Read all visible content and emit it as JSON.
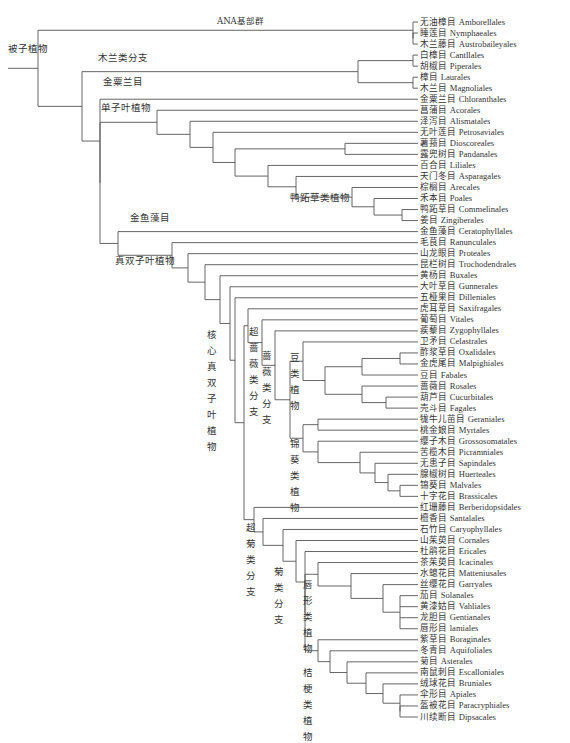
{
  "diagram": {
    "type": "phylogenetic-tree",
    "root_label": "被子植物",
    "leaves": [
      {
        "cn": "无油樟目",
        "en": "Amborellales"
      },
      {
        "cn": "睡莲目",
        "en": "Nymphaeales"
      },
      {
        "cn": "木兰藤目",
        "en": "Austrobaileyales"
      },
      {
        "cn": "白樟目",
        "en": "Cantllales"
      },
      {
        "cn": "胡椒目",
        "en": "Piperales"
      },
      {
        "cn": "樟目",
        "en": "Laurales"
      },
      {
        "cn": "木兰目",
        "en": "Magnoliales"
      },
      {
        "cn": "金粟兰目",
        "en": "Chloranthales"
      },
      {
        "cn": "菖蒲目",
        "en": "Acorales"
      },
      {
        "cn": "泽泻目",
        "en": "Alismatales"
      },
      {
        "cn": "无叶莲目",
        "en": "Petrosaviales"
      },
      {
        "cn": "薯蓣目",
        "en": "Dioscoreales"
      },
      {
        "cn": "露兜树目",
        "en": "Pandanales"
      },
      {
        "cn": "百合目",
        "en": "Liliales"
      },
      {
        "cn": "天门冬目",
        "en": "Asparagales"
      },
      {
        "cn": "棕榈目",
        "en": "Arecales"
      },
      {
        "cn": "禾本目",
        "en": "Poales"
      },
      {
        "cn": "鸭跖草目",
        "en": "Commelinales"
      },
      {
        "cn": "姜目",
        "en": "Zingiberales"
      },
      {
        "cn": "金鱼藻目",
        "en": "Ceratophyllales"
      },
      {
        "cn": "毛茛目",
        "en": "Ranunculales"
      },
      {
        "cn": "山龙眼目",
        "en": "Proteales"
      },
      {
        "cn": "昆栏树目",
        "en": "Trochodendrales"
      },
      {
        "cn": "黄杨目",
        "en": "Buxales"
      },
      {
        "cn": "大叶草目",
        "en": "Gunnerales"
      },
      {
        "cn": "五桠果目",
        "en": "Dilleniales"
      },
      {
        "cn": "虎耳草目",
        "en": "Saxifragales"
      },
      {
        "cn": "葡萄目",
        "en": "Vitales"
      },
      {
        "cn": "蒺藜目",
        "en": "Zygophyllales"
      },
      {
        "cn": "卫矛目",
        "en": "Celastrales"
      },
      {
        "cn": "酢浆草目",
        "en": "Oxalidales"
      },
      {
        "cn": "金虎尾目",
        "en": "Malpighiales"
      },
      {
        "cn": "豆目",
        "en": "Fabales"
      },
      {
        "cn": "蔷薇目",
        "en": "Rosales"
      },
      {
        "cn": "葫芦目",
        "en": "Cucurbitales"
      },
      {
        "cn": "壳斗目",
        "en": "Fagales"
      },
      {
        "cn": "牻牛儿苗目",
        "en": "Geraniales"
      },
      {
        "cn": "桃金娘目",
        "en": "Myrtales"
      },
      {
        "cn": "缨子木目",
        "en": "Grossosomatales"
      },
      {
        "cn": "苦榄木目",
        "en": "Picramniales"
      },
      {
        "cn": "无患子目",
        "en": "Sapindales"
      },
      {
        "cn": "腺椒树目",
        "en": "Huerteales"
      },
      {
        "cn": "锦葵目",
        "en": "Malvales"
      },
      {
        "cn": "十字花目",
        "en": "Brassicales"
      },
      {
        "cn": "红珊藤目",
        "en": "Berberidopsidales"
      },
      {
        "cn": "檀香目",
        "en": "Santalales"
      },
      {
        "cn": "石竹目",
        "en": "Caryophyllales"
      },
      {
        "cn": "山茱萸目",
        "en": "Cornales"
      },
      {
        "cn": "杜鹃花目",
        "en": "Ericales"
      },
      {
        "cn": "茶茱萸目",
        "en": "Icacinales"
      },
      {
        "cn": "水螅花目",
        "en": "Matteniusales"
      },
      {
        "cn": "丝缨花目",
        "en": "Garryales"
      },
      {
        "cn": "茄目",
        "en": "Solanales"
      },
      {
        "cn": "黄漆姑目",
        "en": "Vahliales"
      },
      {
        "cn": "龙胆目",
        "en": "Gentianales"
      },
      {
        "cn": "唇形目",
        "en": "lamiales"
      },
      {
        "cn": "紫草目",
        "en": "Boraginales"
      },
      {
        "cn": "冬青目",
        "en": "Aquifoliales"
      },
      {
        "cn": "菊目",
        "en": "Asterales"
      },
      {
        "cn": "南鼠刺目",
        "en": "Escalloniales"
      },
      {
        "cn": "绒球花目",
        "en": "Bruniales"
      },
      {
        "cn": "伞形目",
        "en": "Apiales"
      },
      {
        "cn": "盔被花目",
        "en": "Paracryphiales"
      },
      {
        "cn": "川续断目",
        "en": "Dipsacales"
      }
    ],
    "clade_labels": {
      "angiosperms": "被子植物",
      "ana_grade": "ANA基部群",
      "magnoliids": "木兰类分支",
      "chloranthales": "金粟兰目",
      "monocots": "单子叶植物",
      "commelinids": "鸭跖草类植物",
      "ceratophyllales": "金鱼藻目",
      "eudicots": "真双子叶植物",
      "core_eudicots": "核心真双子叶植物",
      "superrosids": "超蔷薇类分支",
      "rosids": "蔷薇类分支",
      "fabids": "豆类植物",
      "malvids": "锦葵类植物",
      "superasterids": "超菊类分支",
      "asterids": "菊类分支",
      "lamiids": "唇形类植物",
      "campanulids": "桔梗类植物"
    },
    "tree": {
      "x": 18,
      "c": [
        {
          "x": 38,
          "c": [
            {
              "x": 38,
              "c": [
                {
                  "x": 140,
                  "c": [
                    {
                      "x": 413,
                      "c": [
                        0,
                        {
                          "x": 413,
                          "c": [
                            1,
                            2
                          ]
                        }
                      ]
                    }
                  ]
                },
                {
                  "x": 82,
                  "c": [
                    {
                      "x": 82,
                      "c": [
                        {
                          "x": 358,
                          "c": [
                            {
                              "x": 413,
                              "c": [
                                3,
                                4
                              ]
                            },
                            {
                              "x": 413,
                              "c": [
                                5,
                                6
                              ]
                            }
                          ]
                        }
                      ]
                    },
                    {
                      "x": 100,
                      "c": [
                        7,
                        {
                          "x": 100,
                          "c": [
                            {
                              "x": 157,
                              "c": [
                                8,
                                {
                                  "x": 190,
                                  "c": [
                                    9,
                                    {
                                      "x": 213,
                                      "c": [
                                        10,
                                        {
                                          "x": 235,
                                          "c": [
                                            {
                                              "x": 345,
                                              "c": [
                                                11,
                                                12
                                              ]
                                            },
                                            {
                                              "x": 268,
                                              "c": [
                                                13,
                                                {
                                                  "x": 296,
                                                  "c": [
                                                    14,
                                                    {
                                                      "x": 352,
                                                      "c": [
                                                        15,
                                                        {
                                                          "x": 374,
                                                          "c": [
                                                            16,
                                                            {
                                                              "x": 402,
                                                              "c": [
                                                                17,
                                                                18
                                                              ]
                                                            }
                                                          ]
                                                        }
                                                      ]
                                                    }
                                                  ]
                                                }
                                              ]
                                            }
                                          ]
                                        }
                                      ]
                                    }
                                  ]
                                }
                              ]
                            },
                            {
                              "x": 118,
                              "c": [
                                19,
                                {
                                  "x": 172,
                                  "c": [
                                    20,
                                    {
                                      "x": 188,
                                      "c": [
                                        21,
                                        22
                                      ]
                                    }
                                  ]
                                }
                              ]
                            }
                          ]
                        }
                      ]
                    }
                  ]
                }
              ]
            }
          ]
        }
      ]
    }
  }
}
